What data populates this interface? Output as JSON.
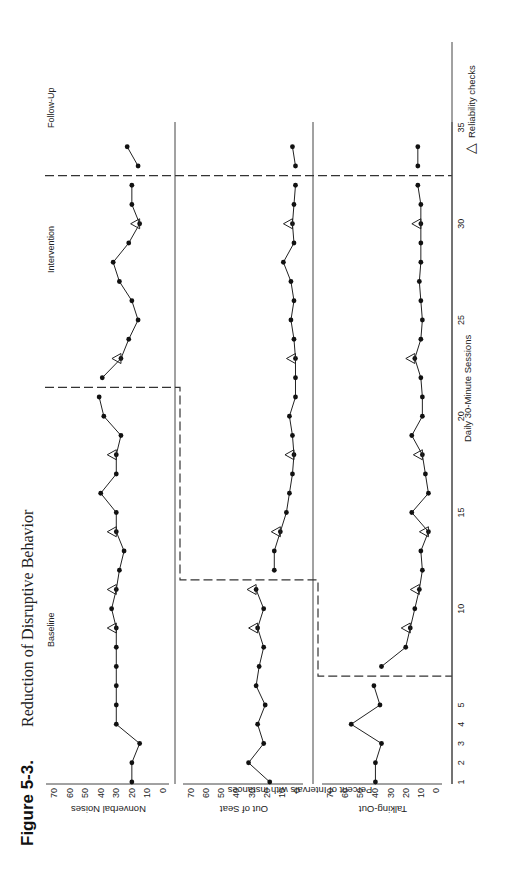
{
  "figure": {
    "number": "Figure 5-3.",
    "title": "Reduction of Disruptive Behavior",
    "orientation": "rotated 90 degrees counter-clockwise"
  },
  "phases": {
    "baseline": "Baseline",
    "intervention": "Intervention",
    "follow_up": "Follow-Up"
  },
  "axes": {
    "x_label": "Daily 30-Minute Sessions",
    "y_label": "Percent of Intervals with Instances",
    "x_ticks": [
      "1",
      "2",
      "3",
      "4",
      "5",
      "10",
      "15",
      "20",
      "25",
      "30",
      "35"
    ],
    "y_ticks": [
      "70",
      "60",
      "50",
      "40",
      "30",
      "20",
      "10",
      "0"
    ]
  },
  "legend": {
    "symbol": "△",
    "label": "Reliability checks"
  },
  "panels": [
    {
      "name": "Nonverbal Noises"
    },
    {
      "name": "Out of Seat"
    },
    {
      "name": "Talking-Out"
    }
  ],
  "chart_data": {
    "type": "line",
    "title": "Figure 5-3. Reduction of Disruptive Behavior",
    "design": "multiple-baseline across behaviors",
    "xlabel": "Daily 30-Minute Sessions",
    "ylabel": "Percent of Intervals with Instances",
    "xlim": [
      0,
      37
    ],
    "ylim": [
      0,
      70
    ],
    "x_ticks": [
      1,
      2,
      3,
      4,
      5,
      10,
      15,
      20,
      25,
      30,
      35
    ],
    "y_ticks": [
      0,
      10,
      20,
      30,
      40,
      50,
      60,
      70
    ],
    "grid": false,
    "legend": "bottom-right: △ Reliability checks",
    "series": [
      {
        "name": "Nonverbal Noises",
        "baseline_sessions": [
          1,
          21
        ],
        "intervention_sessions": [
          22,
          32
        ],
        "follow_up_sessions": [
          33,
          34
        ],
        "x": [
          1,
          2,
          3,
          4,
          5,
          6,
          7,
          8,
          9,
          10,
          11,
          12,
          13,
          14,
          15,
          16,
          17,
          18,
          19,
          20,
          21,
          22,
          23,
          24,
          25,
          26,
          27,
          28,
          29,
          30,
          31,
          32,
          33,
          34
        ],
        "values": [
          20,
          20,
          15,
          30,
          30,
          30,
          30,
          30,
          30,
          33,
          30,
          28,
          25,
          30,
          30,
          40,
          30,
          30,
          27,
          38,
          41,
          39,
          27,
          22,
          16,
          20,
          28,
          32,
          22,
          15,
          20,
          20,
          16,
          23
        ],
        "reliability_checks": [
          9,
          11,
          14,
          18,
          23,
          30
        ]
      },
      {
        "name": "Out of Seat",
        "baseline_sessions": [
          1,
          11
        ],
        "intervention_sessions": [
          12,
          32
        ],
        "follow_up_sessions": [
          33,
          34
        ],
        "x": [
          1,
          2,
          3,
          4,
          5,
          6,
          7,
          8,
          9,
          10,
          11,
          12,
          13,
          14,
          15,
          16,
          17,
          18,
          19,
          20,
          21,
          22,
          23,
          24,
          25,
          26,
          27,
          28,
          29,
          30,
          31,
          32,
          33,
          34
        ],
        "values": [
          18,
          32,
          22,
          26,
          21,
          27,
          25,
          22,
          26,
          22,
          27,
          15,
          15,
          11,
          7,
          5,
          3,
          2,
          3,
          5,
          1,
          1,
          1,
          2,
          4,
          2,
          4,
          9,
          2,
          3,
          2,
          1,
          1,
          3
        ],
        "reliability_checks": [
          9,
          11,
          14,
          18,
          23,
          30
        ]
      },
      {
        "name": "Talking-Out",
        "baseline_sessions": [
          1,
          6
        ],
        "intervention_sessions": [
          7,
          32
        ],
        "follow_up_sessions": [
          33,
          34
        ],
        "x": [
          1,
          2,
          3,
          4,
          5,
          6,
          7,
          8,
          9,
          10,
          11,
          12,
          13,
          14,
          15,
          16,
          17,
          18,
          19,
          20,
          21,
          22,
          23,
          24,
          25,
          26,
          27,
          28,
          29,
          30,
          31,
          32,
          33,
          34
        ],
        "values": [
          40,
          40,
          36,
          56,
          37,
          41,
          36,
          20,
          17,
          14,
          11,
          9,
          10,
          5,
          16,
          5,
          7,
          9,
          16,
          9,
          9,
          10,
          14,
          10,
          9,
          10,
          11,
          10,
          10,
          10,
          10,
          12,
          12,
          12
        ],
        "reliability_checks": [
          9,
          11,
          14,
          18,
          23,
          30
        ]
      }
    ]
  }
}
